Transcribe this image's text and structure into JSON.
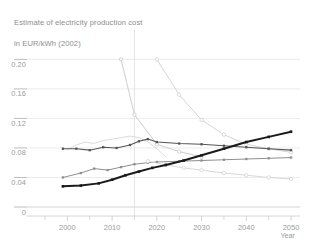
{
  "title": {
    "line1": "Estimate of electricity production cost",
    "line2": "in EUR/kWh (2002)"
  },
  "colors": {
    "background": "#ffffff",
    "text": "#8d8d8d",
    "grid": "#e4e4e4",
    "axis": "#c9c9c9",
    "series_black": "#1a1a1a",
    "series_dark_gray": "#555555",
    "series_mid_gray": "#8f8f8f",
    "series_light_gray": "#c8c8c8",
    "series_pale_gray": "#dcdcdc",
    "reference_line": "#dedede"
  },
  "chart_data": {
    "type": "line",
    "title": "Estimate of electricity production cost in EUR/kWh (2002)",
    "xlabel": "Year",
    "ylabel": "",
    "xlim": [
      1995,
      2052
    ],
    "ylim": [
      0,
      0.21
    ],
    "grid": true,
    "legend": "none",
    "x_ticks": [
      2000,
      2010,
      2020,
      2030,
      2040,
      2050
    ],
    "x_minor_ticks": [
      1995,
      2005,
      2015,
      2025,
      2035,
      2045
    ],
    "y_ticks": [
      0,
      0.04,
      0.08,
      0.12,
      0.16,
      0.2
    ],
    "y_tick_labels": [
      "0",
      "0.04",
      "0.08",
      "0.12",
      "0.16",
      "0.20"
    ],
    "annotations": [
      {
        "type": "vertical-reference-line",
        "x": 2015
      }
    ],
    "series": [
      {
        "name": "steep-decline-a",
        "style": "line-markers-circle",
        "color": "#c8c8c8",
        "width": 0.9,
        "x": [
          2012,
          2015,
          2020,
          2025,
          2030
        ],
        "values": [
          0.2,
          0.125,
          0.085,
          0.075,
          0.068
        ]
      },
      {
        "name": "steep-decline-b",
        "style": "line-markers-circle",
        "color": "#cfcfcf",
        "width": 0.9,
        "x": [
          2020,
          2025,
          2030,
          2035,
          2040,
          2045,
          2050
        ],
        "values": [
          0.2,
          0.152,
          0.118,
          0.098,
          0.085,
          0.079,
          0.074
        ]
      },
      {
        "name": "historical-wavy-light",
        "style": "line",
        "color": "#dcdcdc",
        "width": 1.0,
        "x": [
          2000,
          2002,
          2004,
          2006,
          2008,
          2010,
          2012,
          2014,
          2016,
          2018,
          2020,
          2022
        ],
        "values": [
          0.078,
          0.084,
          0.088,
          0.086,
          0.09,
          0.092,
          0.094,
          0.096,
          0.094,
          0.088,
          0.079,
          0.068
        ]
      },
      {
        "name": "upper-dark-series",
        "style": "line-markers-square",
        "color": "#555555",
        "width": 1.1,
        "x": [
          1999,
          2002,
          2005,
          2008,
          2011,
          2014,
          2016,
          2018,
          2020,
          2025,
          2030,
          2035,
          2040,
          2045,
          2050
        ],
        "values": [
          0.079,
          0.079,
          0.077,
          0.081,
          0.08,
          0.084,
          0.089,
          0.092,
          0.088,
          0.086,
          0.085,
          0.083,
          0.081,
          0.079,
          0.077
        ]
      },
      {
        "name": "mid-gray-series",
        "style": "line-markers-square",
        "color": "#8f8f8f",
        "width": 1.0,
        "x": [
          1999,
          2003,
          2006,
          2009,
          2012,
          2015,
          2018,
          2020,
          2025,
          2030,
          2035,
          2040,
          2045,
          2050
        ],
        "values": [
          0.04,
          0.046,
          0.052,
          0.05,
          0.054,
          0.058,
          0.06,
          0.061,
          0.062,
          0.063,
          0.064,
          0.065,
          0.066,
          0.067
        ]
      },
      {
        "name": "lower-declining-pale",
        "style": "line-markers-circle",
        "color": "#d4d4d4",
        "width": 0.9,
        "x": [
          2018,
          2022,
          2026,
          2030,
          2035,
          2040,
          2045,
          2050
        ],
        "values": [
          0.062,
          0.057,
          0.053,
          0.05,
          0.046,
          0.043,
          0.04,
          0.038
        ]
      },
      {
        "name": "rising-black-series",
        "style": "line-markers-square",
        "color": "#1a1a1a",
        "width": 2.0,
        "x": [
          1999,
          2003,
          2007,
          2010,
          2013,
          2016,
          2019,
          2022,
          2026,
          2030,
          2035,
          2040,
          2045,
          2050
        ],
        "values": [
          0.028,
          0.029,
          0.032,
          0.037,
          0.043,
          0.048,
          0.053,
          0.057,
          0.063,
          0.07,
          0.079,
          0.088,
          0.095,
          0.102
        ]
      }
    ]
  },
  "axes": {
    "x_label": "Year"
  }
}
